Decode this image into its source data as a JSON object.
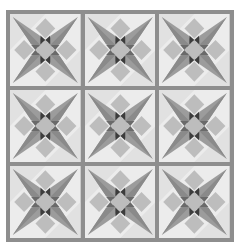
{
  "image": {
    "description": "Quilt pattern: 3x3 grid of eight-pointed star blocks with sashing",
    "rows": 3,
    "cols": 3
  },
  "colors": {
    "sashing": "#8e8e8e",
    "background": "#ececec",
    "background_alt": "#d6d6d6",
    "star_points": "#9c9c9c",
    "star_points_dark": "#8a8a8a",
    "diamond": "#bdbdbd",
    "center_dark": "#3c3c3c",
    "center_mid": "#6a6a6a"
  },
  "blocks": [
    {
      "row": 0,
      "col": 0
    },
    {
      "row": 0,
      "col": 1
    },
    {
      "row": 0,
      "col": 2
    },
    {
      "row": 1,
      "col": 0
    },
    {
      "row": 1,
      "col": 1
    },
    {
      "row": 1,
      "col": 2
    },
    {
      "row": 2,
      "col": 0
    },
    {
      "row": 2,
      "col": 1
    },
    {
      "row": 2,
      "col": 2
    }
  ]
}
